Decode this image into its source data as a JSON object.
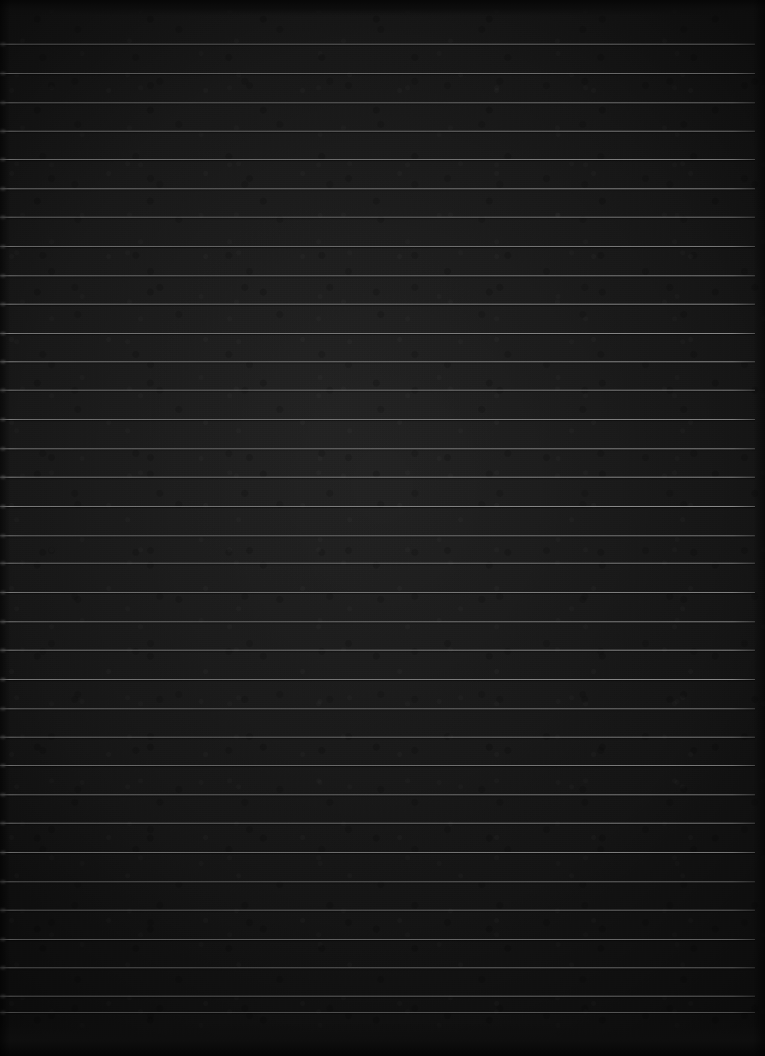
{
  "image": {
    "kind": "lined-paper-photograph",
    "description": "Very dark, near-black photograph of a blank ruled notebook page",
    "width_px": 765,
    "height_px": 1056,
    "visible_text": "",
    "colors": {
      "background_dark": "#1b1b1b",
      "background_mid": "#222222",
      "background_edge": "#0a0a0a",
      "rule_line": "#a8a8a8",
      "rule_line_bright": "#bebebe"
    }
  },
  "ruling": {
    "line_count": 35,
    "first_line_y": 44,
    "line_spacing_px": 28.9,
    "last_line_y": 1012,
    "line_thickness_px": 1,
    "line_left_x": 0,
    "line_right_x": 755,
    "orientation": "horizontal",
    "has_vertical_margin_rule": false,
    "lines_y": [
      44,
      73,
      102,
      131,
      159,
      188,
      217,
      246,
      275,
      304,
      333,
      361,
      390,
      419,
      448,
      477,
      506,
      535,
      563,
      592,
      621,
      650,
      679,
      708,
      737,
      765,
      794,
      823,
      852,
      881,
      910,
      939,
      967,
      996,
      1012
    ]
  }
}
